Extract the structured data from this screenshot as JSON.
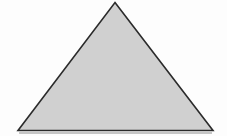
{
  "figure": {
    "shape_name": "isosceles-triangle",
    "canvas": {
      "width": 227,
      "height": 136,
      "background_color": "#ffffff"
    },
    "shape": {
      "type": "triangle",
      "fill_color": "#d2d2d2",
      "stroke_color": "#2b2b2b",
      "stroke_width": 1.6,
      "vertices": [
        {
          "label": "apex",
          "x": 115,
          "y": 2.5
        },
        {
          "label": "bottom-right",
          "x": 213,
          "y": 130.5
        },
        {
          "label": "bottom-left",
          "x": 18,
          "y": 130.5
        }
      ],
      "points_attr": "115,2.5 213,130.5 18,130.5"
    },
    "baseline_shadow": {
      "color": "#c3c3c3",
      "x1": 18,
      "x2": 213,
      "y": 133
    }
  }
}
